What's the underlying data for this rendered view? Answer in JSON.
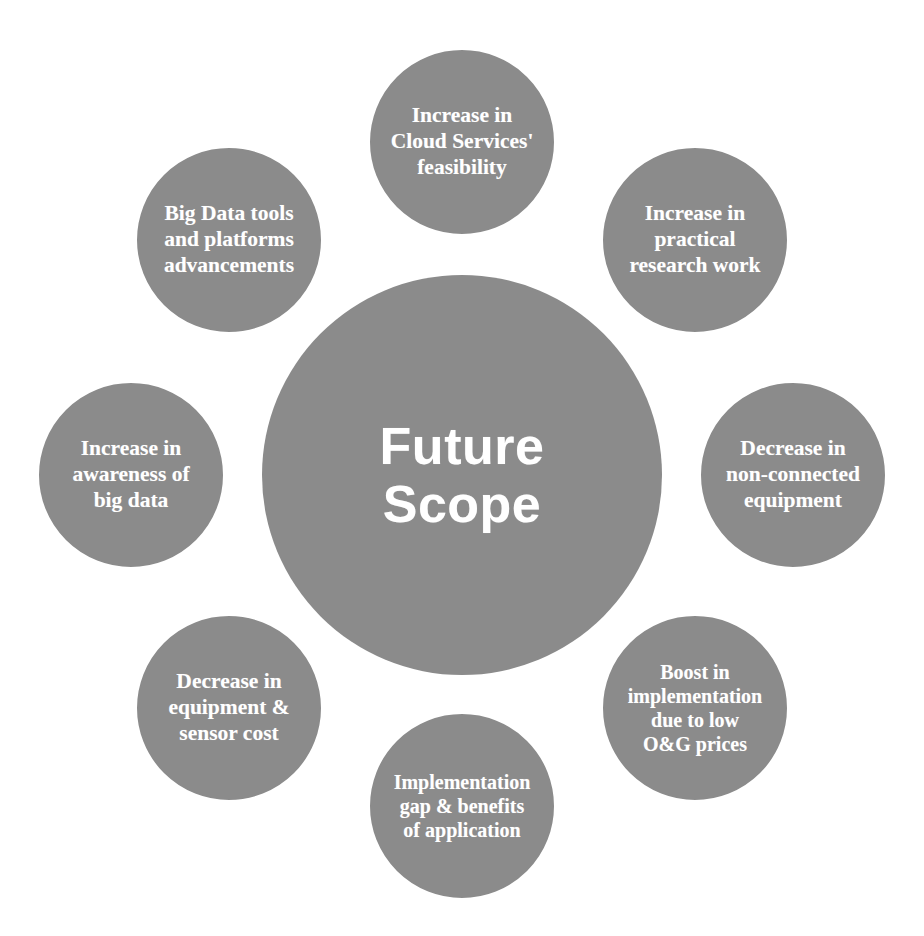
{
  "diagram": {
    "type": "hub-and-spoke-circles",
    "center": {
      "label": "Future\nScope",
      "color": "#8b8b8b",
      "text_color": "#ffffff"
    },
    "style": {
      "node_fill": "#8b8b8b",
      "node_ring": "#ffffff",
      "background": "#ffffff",
      "text_color": "#ffffff"
    },
    "nodes": [
      {
        "id": "cloud-services-feasibility",
        "label": "Increase in\nCloud Services'\nfeasibility",
        "position": "top"
      },
      {
        "id": "practical-research-work",
        "label": "Increase in\npractical\nresearch work",
        "position": "top-right"
      },
      {
        "id": "non-connected-equipment",
        "label": "Decrease in\nnon-connected\nequipment",
        "position": "right"
      },
      {
        "id": "low-og-prices-boost",
        "label": "Boost in\nimplementation\ndue to low\nO&G prices",
        "position": "bottom-right"
      },
      {
        "id": "implementation-gap-benefits",
        "label": "Implementation\ngap & benefits\nof application",
        "position": "bottom"
      },
      {
        "id": "equipment-sensor-cost",
        "label": "Decrease in\nequipment &\nsensor cost",
        "position": "bottom-left"
      },
      {
        "id": "awareness-of-big-data",
        "label": "Increase in\nawareness of\nbig data",
        "position": "left"
      },
      {
        "id": "big-data-tools-platforms",
        "label": "Big Data tools\nand platforms\nadvancements",
        "position": "top-left"
      }
    ]
  }
}
